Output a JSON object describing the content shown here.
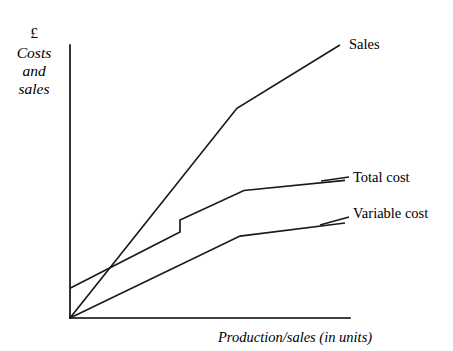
{
  "chart_data": {
    "type": "line",
    "title": "",
    "subtitle": "",
    "ylabel_currency": "£",
    "ylabel_lines": [
      "Costs",
      "and",
      "sales"
    ],
    "xlabel": "Production/sales (in units)",
    "grid": false,
    "legend_position": "right-inline-labels",
    "axis_color": "#000000",
    "line_color": "#1a1a1a",
    "background": "#ffffff",
    "xlim": [
      0,
      100
    ],
    "ylim": [
      0,
      100
    ],
    "axes": {
      "x_axis_from_units": 0,
      "x_axis_to_units": 100,
      "y_axis_from_units": 0,
      "y_axis_to_units": 100,
      "ticks_shown": false,
      "tick_labels": []
    },
    "annotations": [
      {
        "name": "break-even-point",
        "description": "Sales line crosses Total cost line",
        "x_units": 12.5,
        "y_units": 15.7
      },
      {
        "name": "stepped-fixed-cost-increase",
        "description": "Step up in total cost line where fixed costs increase",
        "x_units": 39.3,
        "y_units": 31.5
      }
    ],
    "series": [
      {
        "name": "Sales",
        "label": "Sales",
        "points_units": [
          {
            "x": 0,
            "y": 0
          },
          {
            "x": 59.6,
            "y": 76.8
          },
          {
            "x": 96.4,
            "y": 100.0
          }
        ],
        "stepped": false
      },
      {
        "name": "Total cost",
        "label": "Total cost",
        "points_units": [
          {
            "x": 0,
            "y": 10.9
          },
          {
            "x": 39.3,
            "y": 31.5
          },
          {
            "x": 39.3,
            "y": 35.9
          },
          {
            "x": 62.1,
            "y": 46.7
          },
          {
            "x": 98.2,
            "y": 50.4
          }
        ],
        "stepped": true
      },
      {
        "name": "Variable cost",
        "label": "Variable cost",
        "points_units": [
          {
            "x": 0,
            "y": 0
          },
          {
            "x": 60.7,
            "y": 30.0
          },
          {
            "x": 98.2,
            "y": 34.8
          }
        ],
        "stepped": false
      }
    ]
  },
  "labels": {
    "y_currency": "£",
    "y_line_1": "Costs",
    "y_line_2": "and",
    "y_line_3": "sales",
    "x_caption": "Production/sales (in units)",
    "sales": "Sales",
    "total_cost": "Total cost",
    "variable_cost": "Variable cost"
  }
}
